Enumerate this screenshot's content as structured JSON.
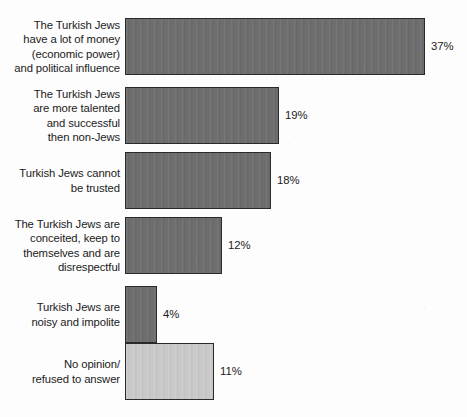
{
  "chart_data": {
    "type": "bar",
    "orientation": "horizontal",
    "title": "",
    "xlabel": "",
    "ylabel": "",
    "grid": false,
    "legend": "none",
    "xlim": [
      0,
      37
    ],
    "value_suffix": "%",
    "categories": [
      "The Turkish Jews\nhave a lot of money\n(economic power)\nand political influence",
      "The Turkish Jews\nare more talented\nand successful\nthen non-Jews",
      "Turkish Jews cannot\nbe trusted",
      "The Turkish Jews are\nconceited, keep to\nthemselves and are\ndisrespectful",
      "Turkish Jews are\nnoisy and impolite",
      "No opinion/\nrefused to answer"
    ],
    "values": [
      37,
      19,
      18,
      12,
      4,
      11
    ],
    "value_labels": [
      "37%",
      "19%",
      "18%",
      "12%",
      "4%",
      "11%"
    ],
    "bar_styles": [
      "dark",
      "dark",
      "dark",
      "dark",
      "dark",
      "light"
    ]
  },
  "colors": {
    "background": "#fdfdfd",
    "bar_dark": "#6e6e6e",
    "bar_light": "#c9c9c9",
    "bar_border": "#2a2a2a",
    "text": "#1b1b1b"
  },
  "geometry": {
    "bar_left": 125,
    "px_per_percent": 8.11,
    "bar_height": 57,
    "row_tops": [
      18,
      87,
      152,
      217,
      286,
      343
    ],
    "bar_heights": [
      57,
      57,
      57,
      57,
      57,
      57
    ]
  }
}
